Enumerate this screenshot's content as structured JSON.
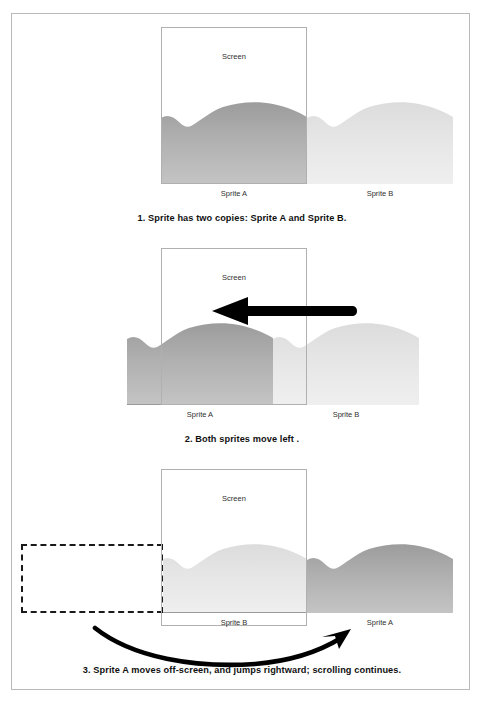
{
  "figure": {
    "border_color": "#b9b9b9",
    "background": "#ffffff"
  },
  "panels": [
    {
      "id": "panel-1",
      "step": 1,
      "caption": "1. Sprite has two copies: Sprite A and Sprite B.",
      "screen_label": "Screen",
      "labels": [
        {
          "name": "sprite-a-label",
          "text": "Sprite A"
        },
        {
          "name": "sprite-b-label",
          "text": "Sprite B"
        }
      ],
      "sprites": [
        {
          "name": "Sprite A",
          "shade": "#a8a8a8",
          "position": "inside-screen"
        },
        {
          "name": "Sprite B",
          "shade": "#e4e4e4",
          "position": "right-of-screen"
        }
      ],
      "screen": {
        "x": 161,
        "y": 27,
        "width": 146,
        "height": 157
      }
    },
    {
      "id": "panel-2",
      "step": 2,
      "caption": "2. Both sprites move left .",
      "screen_label": "Screen",
      "labels": [
        {
          "name": "sprite-a-label",
          "text": "Sprite A"
        },
        {
          "name": "sprite-b-label",
          "text": "Sprite B"
        }
      ],
      "sprites": [
        {
          "name": "Sprite A",
          "shade": "#a8a8a8",
          "position": "shifted-left-partly-offscreen"
        },
        {
          "name": "Sprite B",
          "shade": "#e4e4e4",
          "position": "entering-screen-from-right"
        }
      ],
      "arrow": {
        "name": "left-arrow",
        "direction": "left",
        "color": "#000000"
      },
      "screen": {
        "x": 161,
        "y": 248,
        "width": 146,
        "height": 157
      }
    },
    {
      "id": "panel-3",
      "step": 3,
      "caption": "3. Sprite A moves off-screen, and jumps rightward; scrolling continues.",
      "screen_label": "Screen",
      "labels": [
        {
          "name": "sprite-b-label",
          "text": "Sprite B"
        },
        {
          "name": "sprite-a-label",
          "text": "Sprite A"
        }
      ],
      "sprites": [
        {
          "name": "Sprite B",
          "shade": "#e4e4e4",
          "position": "inside-screen"
        },
        {
          "name": "Sprite A",
          "shade": "#a8a8a8",
          "position": "jumped-right-of-screen"
        }
      ],
      "dashed_placeholder": {
        "name": "old-sprite-a-position",
        "style": "dashed"
      },
      "arrow": {
        "name": "curved-jump-arrow",
        "direction": "left-to-right-curved",
        "color": "#000000"
      },
      "screen": {
        "x": 161,
        "y": 469,
        "width": 146,
        "height": 157
      }
    }
  ],
  "colors": {
    "sprite_dark": "#a8a8a8",
    "sprite_light": "#e4e4e4",
    "screen_border": "#b0b0b0",
    "frame_border": "#b9b9b9",
    "arrow": "#000000",
    "text": "#111111"
  }
}
